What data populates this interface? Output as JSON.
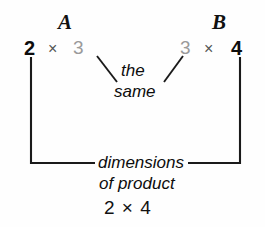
{
  "figure": {
    "caption_semantics": "matrix-multiplication-dimension-rule",
    "matrix_a": {
      "name": "A",
      "rows": "2",
      "times": "×",
      "cols": "3"
    },
    "matrix_b": {
      "name": "B",
      "rows": "3",
      "times": "×",
      "cols": "4"
    },
    "inner_note": {
      "line1": "the",
      "line2": "same"
    },
    "bracket_note": {
      "line1": "dimensions",
      "line2": "of product"
    },
    "result": {
      "rows": "2",
      "times": "×",
      "cols": "4",
      "expression": "2 × 4"
    },
    "colors": {
      "ink": "#0d0d0d",
      "muted": "#9a9a9a",
      "times_gray": "#555555",
      "rule": "#1a1a1a",
      "background": "#fefefe"
    }
  }
}
